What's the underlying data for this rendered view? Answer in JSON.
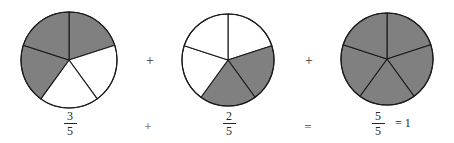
{
  "figure": {
    "background_color": "#ffffff",
    "shaded_color": "#808080",
    "unshaded_color": "#ffffff",
    "stroke_color": "#1a1a1a"
  },
  "pies": [
    {
      "name": "pie-three-fifths",
      "slices_total": 5,
      "slices_shaded": 3,
      "shaded_indices": [
        0,
        3,
        4
      ],
      "center_x": 69,
      "center_y": 60,
      "radius": 48
    },
    {
      "name": "pie-two-fifths",
      "slices_total": 5,
      "slices_shaded": 2,
      "shaded_indices": [
        1,
        2
      ],
      "center_x": 228,
      "center_y": 60,
      "radius": 46
    },
    {
      "name": "pie-five-fifths",
      "slices_total": 5,
      "slices_shaded": 5,
      "shaded_indices": [
        0,
        1,
        2,
        3,
        4
      ],
      "center_x": 387,
      "center_y": 59,
      "radius": 46
    }
  ],
  "top_operators": [
    {
      "symbol": "+",
      "x": 142
    },
    {
      "symbol": "+",
      "x": 301
    }
  ],
  "expression": {
    "term1": {
      "numerator": "3",
      "denominator": "5"
    },
    "operator1": "+",
    "term2": {
      "numerator": "2",
      "denominator": "5"
    },
    "operator2": "=",
    "term3": {
      "numerator": "5",
      "denominator": "5"
    },
    "result_equals": "=",
    "result_value": "1",
    "result_tail": "= 1"
  },
  "chart_data": {
    "type": "pie",
    "title": "3/5 + 2/5 = 5/5 = 1",
    "xlabel": "",
    "ylabel": "",
    "grid": false,
    "legend": "none",
    "charts": [
      {
        "label": "3/5",
        "categories": [
          "shaded",
          "unshaded"
        ],
        "values": [
          3,
          5
        ],
        "slice_fraction": 0.2,
        "slices": [
          "shaded",
          "unshaded",
          "unshaded",
          "shaded",
          "shaded"
        ]
      },
      {
        "label": "2/5",
        "categories": [
          "shaded",
          "unshaded"
        ],
        "values": [
          2,
          3
        ],
        "slice_fraction": 0.2,
        "slices": [
          "unshaded",
          "shaded",
          "shaded",
          "unshaded",
          "unshaded"
        ]
      },
      {
        "label": "5/5 = 1",
        "categories": [
          "shaded",
          "unshaded"
        ],
        "values": [
          5,
          0
        ],
        "slice_fraction": 0.2,
        "slices": [
          "shaded",
          "shaded",
          "shaded",
          "shaded",
          "shaded"
        ]
      }
    ]
  }
}
